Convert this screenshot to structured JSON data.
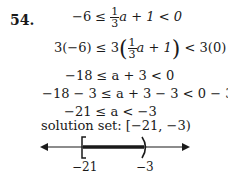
{
  "problem": {
    "number": "54.",
    "steps": [
      {
        "left": "−6 ≤ ",
        "frac_num": "1",
        "frac_den": "3",
        "right": "a + 1 < 0"
      },
      {
        "left": "3(−6) ≤ 3",
        "frac_num": "1",
        "frac_den": "3",
        "inner": "a + 1",
        "right": " < 3(0)"
      },
      {
        "text": "−18 ≤ a + 3 < 0"
      },
      {
        "text": "−18 − 3 ≤ a + 3 − 3 < 0 − 3"
      },
      {
        "text": "−21 ≤ a < −3"
      }
    ],
    "solution_label": "solution set: [−21, −3)",
    "number_line": {
      "left_label": "−21",
      "right_label": "−3",
      "left_bracket": "[",
      "right_bracket": ")",
      "color": "#1a1a1a"
    }
  }
}
